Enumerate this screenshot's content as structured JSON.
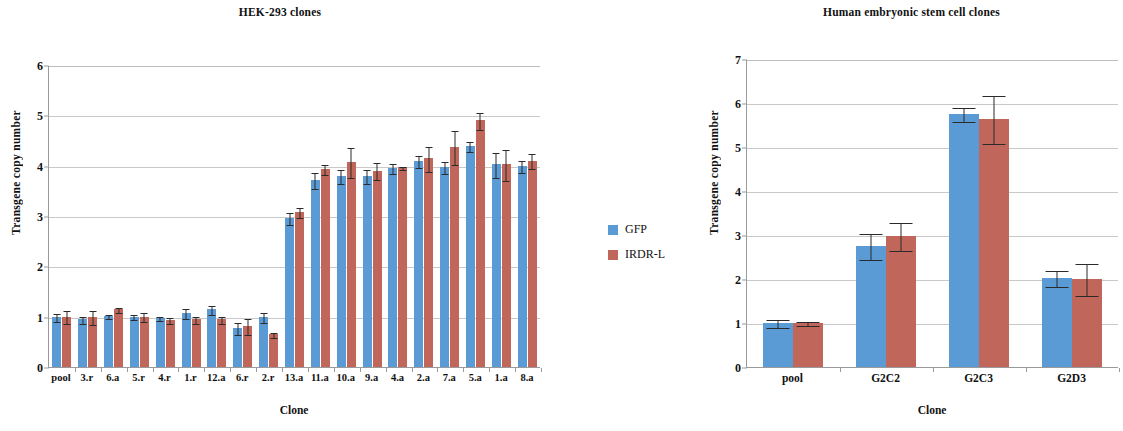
{
  "figure": {
    "background": "#ffffff",
    "series_colors": {
      "gfp": "#5b9bd5",
      "irdr": "#c0665a"
    }
  },
  "legend": {
    "position": "between-panels",
    "items": [
      {
        "label": "GFP",
        "color": "#5b9bd5",
        "swatch": "blue-square-swatch"
      },
      {
        "label": "IRDR-L",
        "color": "#c0665a",
        "swatch": "red-square-swatch"
      }
    ]
  },
  "chart_data": [
    {
      "id": "hek293",
      "type": "bar",
      "title": "HEK-293 clones",
      "xlabel": "Clone",
      "ylabel": "Transgene copy number",
      "ylim": [
        0,
        6
      ],
      "yticks": [
        0,
        1,
        2,
        3,
        4,
        5,
        6
      ],
      "grid": true,
      "legend": [
        "GFP",
        "IRDR-L"
      ],
      "categories": [
        "pool",
        "3.r",
        "6.a",
        "5.r",
        "4.r",
        "1.r",
        "12.a",
        "6.r",
        "2.r",
        "13.a",
        "11.a",
        "10.a",
        "9.a",
        "4.a",
        "2.a",
        "7.a",
        "5.a",
        "1.a",
        "8.a"
      ],
      "series": [
        {
          "name": "GFP",
          "color": "#5b9bd5",
          "values": [
            1.0,
            0.95,
            1.02,
            1.0,
            0.98,
            1.08,
            1.15,
            0.78,
            1.0,
            2.96,
            3.72,
            3.8,
            3.8,
            3.95,
            4.1,
            3.97,
            4.4,
            4.03,
            4.0
          ],
          "errors": [
            0.08,
            0.07,
            0.04,
            0.05,
            0.04,
            0.1,
            0.09,
            0.12,
            0.1,
            0.12,
            0.16,
            0.14,
            0.14,
            0.1,
            0.12,
            0.12,
            0.1,
            0.25,
            0.12
          ]
        },
        {
          "name": "IRDR-L",
          "color": "#c0665a",
          "values": [
            1.0,
            1.0,
            1.15,
            1.0,
            0.93,
            0.95,
            0.95,
            0.82,
            0.65,
            3.08,
            3.93,
            4.08,
            3.9,
            3.97,
            4.15,
            4.37,
            4.9,
            4.03,
            4.1
          ],
          "errors": [
            0.13,
            0.14,
            0.05,
            0.09,
            0.06,
            0.07,
            0.07,
            0.16,
            0.05,
            0.1,
            0.1,
            0.3,
            0.17,
            0.03,
            0.25,
            0.33,
            0.17,
            0.31,
            0.15
          ]
        }
      ]
    },
    {
      "id": "hesc",
      "type": "bar",
      "title": "Human embryonic stem cell clones",
      "xlabel": "Clone",
      "ylabel": "Transgene copy number",
      "ylim": [
        0,
        7
      ],
      "yticks": [
        0,
        1,
        2,
        3,
        4,
        5,
        6,
        7
      ],
      "grid": true,
      "legend": [
        "GFP",
        "IRDR-L"
      ],
      "categories": [
        "pool",
        "G2C2",
        "G2C3",
        "G2D3"
      ],
      "series": [
        {
          "name": "GFP",
          "color": "#5b9bd5",
          "values": [
            1.0,
            2.75,
            5.75,
            2.03
          ],
          "errors": [
            0.1,
            0.3,
            0.17,
            0.18
          ]
        },
        {
          "name": "IRDR-L",
          "color": "#c0665a",
          "values": [
            1.0,
            2.98,
            5.63,
            2.0
          ],
          "errors": [
            0.04,
            0.32,
            0.55,
            0.36
          ]
        }
      ]
    }
  ]
}
